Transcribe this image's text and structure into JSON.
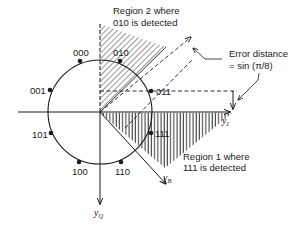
{
  "diagram": {
    "type": "8-PSK signal constellation with decision regions",
    "colors": {
      "ink": "#1a1a1a",
      "background": "#ffffff"
    },
    "axes": {
      "in_phase": {
        "label": "y",
        "subscript": "I"
      },
      "quadrature": {
        "label": "y",
        "subscript": "Q"
      },
      "rotated": {
        "label": "y",
        "subscript": "B"
      }
    },
    "points": [
      {
        "label": "000"
      },
      {
        "label": "010"
      },
      {
        "label": "011"
      },
      {
        "label": "001"
      },
      {
        "label": "101"
      },
      {
        "label": "100"
      },
      {
        "label": "110"
      },
      {
        "label": "111"
      }
    ],
    "regions": {
      "region2": {
        "line1": "Region 2 where",
        "line2": "010 is detected"
      },
      "region1": {
        "line1": "Region 1 where",
        "line2": "111 is detected"
      }
    },
    "annotation": {
      "line1": "Error distance",
      "line2": "= sin (π/8)"
    }
  }
}
